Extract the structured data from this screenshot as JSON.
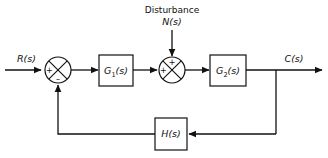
{
  "diagram": {
    "type": "control-system-block-diagram",
    "background_color": "#ffffff",
    "line_color": "#111111",
    "signals": {
      "input_label": "R(s)",
      "output_label": "C(s)",
      "disturbance_title": "Disturbance",
      "disturbance_label": "N(s)"
    },
    "blocks": [
      {
        "name": "forward-gain-1",
        "base": "G",
        "subscript": "1",
        "arg": "(s)"
      },
      {
        "name": "forward-gain-2",
        "base": "G",
        "subscript": "2",
        "arg": "(s)"
      },
      {
        "name": "feedback-gain",
        "base": "H",
        "subscript": "",
        "arg": "(s)"
      }
    ],
    "summing_junctions": [
      {
        "name": "error-summing-junction",
        "signs": {
          "left": "+",
          "bottom": "–"
        }
      },
      {
        "name": "disturbance-summing-junction",
        "signs": {
          "left": "+",
          "top": "+"
        }
      }
    ]
  }
}
